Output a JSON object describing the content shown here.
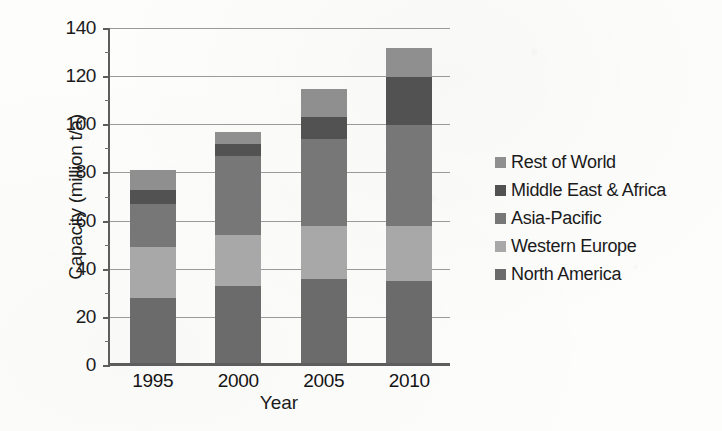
{
  "chart_data": {
    "type": "bar",
    "stacked": true,
    "title": "",
    "xlabel": "Year",
    "ylabel": "Capacity (million t/a)",
    "categories": [
      "1995",
      "2000",
      "2005",
      "2010"
    ],
    "ylim": [
      0,
      140
    ],
    "ytick_labels": [
      "0",
      "20",
      "40",
      "60",
      "80",
      "100",
      "120",
      "140"
    ],
    "ytick_values": [
      0,
      20,
      40,
      60,
      80,
      100,
      120,
      140
    ],
    "grid": "horizontal",
    "legend_position": "right",
    "series": [
      {
        "name": "North America",
        "color": "#6b6b6b",
        "values": [
          27,
          32,
          35,
          34
        ]
      },
      {
        "name": "Western Europe",
        "color": "#a8a8a8",
        "values": [
          21,
          21,
          22,
          23
        ]
      },
      {
        "name": "Asia-Pacific",
        "color": "#777777",
        "values": [
          18,
          33,
          36,
          42
        ]
      },
      {
        "name": "Middle East & Africa",
        "color": "#525252",
        "values": [
          6,
          5,
          9,
          20
        ]
      },
      {
        "name": "Rest of World",
        "color": "#8f8f8f",
        "values": [
          8,
          5,
          12,
          12
        ]
      }
    ],
    "totals": [
      80,
      96,
      114,
      131
    ],
    "legend_order_top_to_bottom": [
      "Rest of World",
      "Middle East & Africa",
      "Asia-Pacific",
      "Western Europe",
      "North America"
    ]
  },
  "legend": {
    "items": [
      {
        "label": "Rest of World",
        "color": "#8f8f8f"
      },
      {
        "label": "Middle East & Africa",
        "color": "#525252"
      },
      {
        "label": "Asia-Pacific",
        "color": "#777777"
      },
      {
        "label": "Western Europe",
        "color": "#a8a8a8"
      },
      {
        "label": "North America",
        "color": "#6b6b6b"
      }
    ]
  },
  "axes": {
    "y_title": "Capacity (million t/a)",
    "x_title": "Year"
  }
}
